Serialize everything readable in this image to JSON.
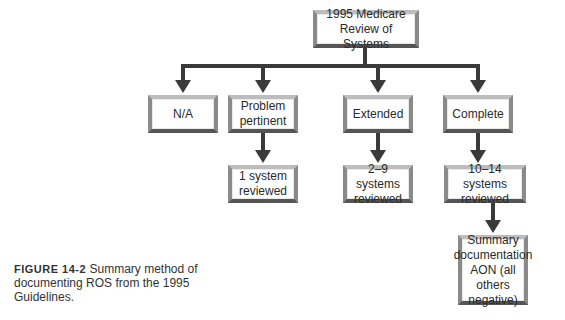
{
  "diagram": {
    "root": {
      "label": "1995 Medicare\nReview of Systems"
    },
    "level1": [
      {
        "label": "N/A"
      },
      {
        "label": "Problem\npertinent"
      },
      {
        "label": "Extended"
      },
      {
        "label": "Complete"
      }
    ],
    "level2": [
      {
        "label": "1 system\nreviewed",
        "parent": "Problem pertinent"
      },
      {
        "label": "2–9 systems\nreviewed",
        "parent": "Extended"
      },
      {
        "label": "10–14 systems\nreviewed",
        "parent": "Complete"
      }
    ],
    "level3": [
      {
        "label": "Summary\ndocumentation\nAON (all others\nnegative)",
        "parent": "10–14 systems reviewed"
      }
    ],
    "colors": {
      "line": "#3a3a3a",
      "box_border": "#555555",
      "background": "#ffffff"
    }
  },
  "caption": {
    "figure_label": "FIGURE 14-2",
    "text": " Summary method of documenting ROS from the 1995 Guidelines."
  }
}
